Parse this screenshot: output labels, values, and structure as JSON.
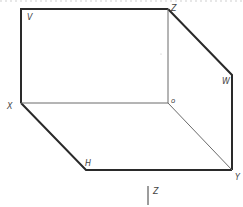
{
  "diagram": {
    "vertices": {
      "V": {
        "x": 21,
        "y": 9
      },
      "Z": {
        "x": 168,
        "y": 9
      },
      "X": {
        "x": 21,
        "y": 103
      },
      "O": {
        "x": 168,
        "y": 103
      },
      "W": {
        "x": 232,
        "y": 75
      },
      "Y": {
        "x": 232,
        "y": 170
      },
      "H": {
        "x": 86,
        "y": 170
      }
    },
    "labels": {
      "v": "V",
      "z_top": "Z",
      "w": "W",
      "x": "X",
      "o": "o",
      "h": "H",
      "y": "Y",
      "z_bottom": "Z"
    },
    "colors": {
      "outer_edge": "#2a2a2a",
      "inner_edge": "#6a6a6a",
      "label": "#444444"
    }
  }
}
